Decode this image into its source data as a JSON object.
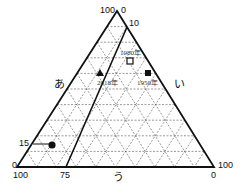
{
  "diagram": {
    "type": "ternary",
    "axes": {
      "left": "あ",
      "right": "い",
      "bottom": "う"
    },
    "tick_labels": {
      "apex_left": "100",
      "apex_right": "0",
      "top_10": "10",
      "left_15": "15",
      "left_0": "0",
      "bottom_left_100": "100",
      "bottom_75": "75",
      "bottom_right_0": "0",
      "right_100": "100"
    },
    "points": [
      {
        "label": "1980年",
        "marker": "open-square"
      },
      {
        "label": "2018年",
        "marker": "filled-triangle"
      },
      {
        "label": "1950年",
        "marker": "filled-square"
      },
      {
        "label": "",
        "marker": "filled-circle"
      }
    ],
    "gridlines": "dashed every 10%"
  }
}
